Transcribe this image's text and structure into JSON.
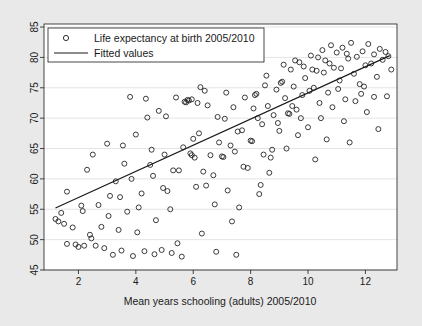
{
  "chart_data": {
    "type": "scatter",
    "title": "",
    "xlabel": "Mean years schooling (adults) 2005/2010",
    "ylabel": "",
    "xlim": [
      0.8,
      13.1
    ],
    "ylim": [
      45,
      85.5
    ],
    "xticks": [
      2,
      4,
      6,
      8,
      10,
      12
    ],
    "yticks": [
      45,
      50,
      55,
      60,
      65,
      70,
      75,
      80,
      85
    ],
    "grid": "horizontal",
    "legend_position": "top-left",
    "series": [
      {
        "name": "Life expectancy at birth 2005/2010",
        "marker": "open-circle",
        "type": "scatter",
        "points": [
          [
            1.2,
            53.4
          ],
          [
            1.3,
            53.0
          ],
          [
            1.4,
            54.4
          ],
          [
            1.5,
            52.6
          ],
          [
            1.6,
            57.9
          ],
          [
            1.6,
            49.3
          ],
          [
            1.8,
            52.0
          ],
          [
            1.9,
            49.2
          ],
          [
            2.0,
            48.8
          ],
          [
            2.1,
            55.6
          ],
          [
            2.2,
            49.0
          ],
          [
            2.3,
            61.5
          ],
          [
            2.4,
            50.8
          ],
          [
            2.5,
            64.0
          ],
          [
            2.6,
            49.0
          ],
          [
            2.7,
            55.7
          ],
          [
            2.8,
            52.1
          ],
          [
            2.9,
            48.6
          ],
          [
            3.0,
            65.8
          ],
          [
            3.1,
            57.2
          ],
          [
            3.2,
            47.5
          ],
          [
            3.3,
            59.6
          ],
          [
            3.4,
            51.6
          ],
          [
            3.5,
            48.2
          ],
          [
            3.6,
            62.5
          ],
          [
            3.7,
            54.6
          ],
          [
            3.8,
            73.5
          ],
          [
            3.9,
            47.3
          ],
          [
            4.0,
            67.3
          ],
          [
            4.1,
            55.3
          ],
          [
            4.2,
            57.6
          ],
          [
            4.3,
            48.1
          ],
          [
            4.4,
            70.1
          ],
          [
            4.5,
            62.3
          ],
          [
            4.6,
            60.5
          ],
          [
            4.7,
            53.2
          ],
          [
            4.8,
            71.2
          ],
          [
            4.9,
            48.3
          ],
          [
            5.0,
            64.0
          ],
          [
            5.1,
            58.0
          ],
          [
            5.2,
            55.0
          ],
          [
            5.3,
            61.4
          ],
          [
            5.4,
            73.4
          ],
          [
            5.5,
            61.4
          ],
          [
            5.6,
            47.2
          ],
          [
            5.7,
            72.7
          ],
          [
            5.75,
            72.6
          ],
          [
            5.8,
            73.0
          ],
          [
            5.85,
            72.9
          ],
          [
            5.9,
            64.2
          ],
          [
            5.95,
            63.9
          ],
          [
            6.0,
            66.6
          ],
          [
            6.1,
            58.7
          ],
          [
            6.2,
            67.5
          ],
          [
            6.3,
            51.0
          ],
          [
            6.4,
            74.5
          ],
          [
            6.5,
            72.1
          ],
          [
            6.6,
            63.9
          ],
          [
            6.7,
            60.6
          ],
          [
            6.8,
            48.0
          ],
          [
            6.9,
            66.0
          ],
          [
            7.0,
            63.7
          ],
          [
            7.05,
            63.6
          ],
          [
            7.1,
            69.9
          ],
          [
            7.2,
            58.1
          ],
          [
            7.3,
            65.5
          ],
          [
            7.4,
            71.8
          ],
          [
            7.5,
            47.5
          ],
          [
            7.6,
            55.3
          ],
          [
            7.7,
            68.0
          ],
          [
            7.8,
            73.4
          ],
          [
            7.9,
            61.8
          ],
          [
            8.0,
            66.3
          ],
          [
            8.05,
            66.2
          ],
          [
            8.1,
            71.6
          ],
          [
            8.2,
            74.0
          ],
          [
            8.3,
            57.5
          ],
          [
            8.4,
            69.0
          ],
          [
            8.5,
            75.4
          ],
          [
            8.6,
            72.0
          ],
          [
            8.7,
            63.5
          ],
          [
            8.8,
            70.5
          ],
          [
            8.9,
            74.7
          ],
          [
            9.0,
            67.9
          ],
          [
            9.1,
            76.0
          ],
          [
            9.2,
            73.3
          ],
          [
            9.3,
            70.8
          ],
          [
            9.35,
            70.7
          ],
          [
            9.4,
            78.0
          ],
          [
            9.5,
            75.2
          ],
          [
            9.6,
            71.4
          ],
          [
            9.7,
            79.2
          ],
          [
            9.8,
            73.8
          ],
          [
            9.9,
            76.6
          ],
          [
            10.0,
            68.5
          ],
          [
            10.1,
            80.3
          ],
          [
            10.2,
            75.0
          ],
          [
            10.3,
            77.8
          ],
          [
            10.4,
            72.5
          ],
          [
            10.5,
            81.2
          ],
          [
            10.6,
            79.5
          ],
          [
            10.7,
            74.2
          ],
          [
            10.8,
            82.0
          ],
          [
            10.9,
            78.3
          ],
          [
            11.0,
            80.8
          ],
          [
            11.1,
            76.2
          ],
          [
            11.2,
            81.6
          ],
          [
            11.3,
            73.1
          ],
          [
            11.4,
            79.8
          ],
          [
            11.5,
            82.4
          ],
          [
            11.6,
            77.3
          ],
          [
            11.7,
            80.1
          ],
          [
            11.8,
            75.6
          ],
          [
            11.9,
            81.0
          ],
          [
            12.0,
            78.7
          ],
          [
            12.1,
            82.2
          ],
          [
            12.2,
            79.0
          ],
          [
            12.3,
            80.5
          ],
          [
            12.4,
            76.8
          ],
          [
            12.5,
            81.4
          ],
          [
            12.6,
            79.6
          ],
          [
            12.7,
            80.9
          ],
          [
            12.8,
            80.2
          ],
          [
            12.9,
            78.0
          ],
          [
            2.15,
            54.7
          ],
          [
            2.45,
            50.2
          ],
          [
            3.05,
            53.9
          ],
          [
            3.55,
            65.5
          ],
          [
            4.05,
            51.2
          ],
          [
            4.35,
            73.2
          ],
          [
            4.65,
            47.6
          ],
          [
            5.05,
            70.3
          ],
          [
            5.45,
            49.4
          ],
          [
            5.65,
            65.2
          ],
          [
            6.05,
            63.5
          ],
          [
            6.25,
            75.1
          ],
          [
            6.45,
            58.9
          ],
          [
            6.85,
            70.2
          ],
          [
            7.15,
            74.2
          ],
          [
            7.35,
            53.0
          ],
          [
            7.55,
            67.8
          ],
          [
            7.75,
            62.0
          ],
          [
            8.15,
            73.8
          ],
          [
            8.35,
            59.0
          ],
          [
            8.55,
            77.0
          ],
          [
            8.75,
            64.8
          ],
          [
            9.05,
            75.8
          ],
          [
            9.25,
            65.0
          ],
          [
            9.45,
            72.0
          ],
          [
            9.65,
            67.2
          ],
          [
            9.85,
            78.5
          ],
          [
            10.05,
            74.5
          ],
          [
            10.25,
            63.2
          ],
          [
            10.45,
            70.0
          ],
          [
            10.65,
            66.5
          ],
          [
            10.85,
            71.8
          ],
          [
            11.05,
            74.8
          ],
          [
            11.25,
            69.5
          ],
          [
            11.45,
            66.0
          ],
          [
            11.65,
            72.8
          ],
          [
            11.85,
            74.0
          ],
          [
            12.05,
            71.0
          ],
          [
            12.45,
            68.2
          ],
          [
            12.75,
            73.6
          ],
          [
            5.95,
            73.1
          ],
          [
            6.15,
            72.5
          ],
          [
            9.15,
            78.8
          ],
          [
            9.55,
            79.5
          ],
          [
            10.15,
            78.0
          ],
          [
            10.35,
            80.0
          ],
          [
            10.55,
            77.5
          ],
          [
            10.75,
            79.0
          ],
          [
            11.15,
            78.2
          ],
          [
            11.35,
            80.6
          ],
          [
            8.45,
            64.0
          ],
          [
            8.65,
            61.0
          ],
          [
            7.45,
            64.5
          ],
          [
            6.75,
            55.8
          ],
          [
            6.35,
            61.2
          ],
          [
            5.25,
            47.8
          ],
          [
            4.95,
            58.5
          ],
          [
            4.55,
            64.8
          ],
          [
            3.85,
            60.0
          ],
          [
            3.45,
            57.0
          ],
          [
            12.3,
            73.5
          ],
          [
            11.95,
            75.2
          ],
          [
            9.75,
            70.0
          ],
          [
            8.95,
            69.2
          ],
          [
            8.25,
            70.0
          ]
        ]
      },
      {
        "name": "Fitted values",
        "type": "line",
        "x": [
          1.2,
          12.85
        ],
        "y": [
          55.2,
          80.3
        ]
      }
    ]
  },
  "legend": {
    "items": [
      {
        "label": "Life expectancy at birth 2005/2010",
        "marker": "circle"
      },
      {
        "label": "Fitted values",
        "marker": "line"
      }
    ]
  },
  "colors": {
    "background": "#e9e9e9",
    "plot_background": "#ffffff",
    "marker": "#1a1a1a",
    "line": "#1a1a1a",
    "grid": "#d8d8d8",
    "axis": "#1a1a1a"
  }
}
